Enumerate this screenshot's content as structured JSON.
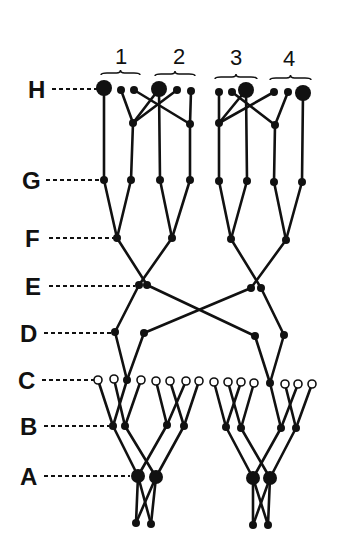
{
  "title_fragment": "(a)",
  "levels": [
    {
      "label": "H",
      "y": 89,
      "label_x": 28,
      "dash_to": 100
    },
    {
      "label": "G",
      "y": 180,
      "label_x": 22,
      "dash_to": 101
    },
    {
      "label": "F",
      "y": 238,
      "label_x": 25,
      "dash_to": 114
    },
    {
      "label": "E",
      "y": 286,
      "label_x": 25,
      "dash_to": 135
    },
    {
      "label": "D",
      "y": 333,
      "label_x": 20,
      "dash_to": 111
    },
    {
      "label": "C",
      "y": 380,
      "label_x": 18,
      "dash_to": 94
    },
    {
      "label": "B",
      "y": 426,
      "label_x": 20,
      "dash_to": 109
    },
    {
      "label": "A",
      "y": 476,
      "label_x": 20,
      "dash_to": 130
    }
  ],
  "groups": [
    {
      "label": "1",
      "x": 121,
      "brace": [
        101,
        140,
        73
      ]
    },
    {
      "label": "2",
      "x": 179,
      "brace": [
        155,
        195,
        74
      ]
    },
    {
      "label": "3",
      "x": 236,
      "brace": [
        215,
        257,
        77
      ]
    },
    {
      "label": "4",
      "x": 289,
      "brace": [
        270,
        311,
        78
      ]
    }
  ],
  "nodes": {
    "H": [
      {
        "x": 104,
        "y": 88,
        "r": 8,
        "type": "filled"
      },
      {
        "x": 121,
        "y": 90,
        "r": 4,
        "type": "filled"
      },
      {
        "x": 134,
        "y": 90,
        "r": 4,
        "type": "filled"
      },
      {
        "x": 159,
        "y": 89,
        "r": 8,
        "type": "filled"
      },
      {
        "x": 177,
        "y": 90,
        "r": 4,
        "type": "filled"
      },
      {
        "x": 191,
        "y": 91,
        "r": 4,
        "type": "filled"
      },
      {
        "x": 219,
        "y": 92,
        "r": 4,
        "type": "filled"
      },
      {
        "x": 232,
        "y": 92,
        "r": 4,
        "type": "filled"
      },
      {
        "x": 246,
        "y": 90,
        "r": 8,
        "type": "filled"
      },
      {
        "x": 274,
        "y": 92,
        "r": 4,
        "type": "filled"
      },
      {
        "x": 288,
        "y": 92,
        "r": 4,
        "type": "filled"
      },
      {
        "x": 303,
        "y": 93,
        "r": 8,
        "type": "filled"
      }
    ],
    "H_mid": [
      {
        "x": 133,
        "y": 123,
        "r": 4,
        "type": "filled"
      },
      {
        "x": 190,
        "y": 124,
        "r": 4,
        "type": "filled"
      },
      {
        "x": 219,
        "y": 123,
        "r": 4,
        "type": "filled"
      },
      {
        "x": 275,
        "y": 125,
        "r": 4,
        "type": "filled"
      }
    ],
    "G": [
      {
        "x": 104,
        "y": 180,
        "r": 4,
        "type": "filled"
      },
      {
        "x": 131,
        "y": 180,
        "r": 4,
        "type": "filled"
      },
      {
        "x": 160,
        "y": 180,
        "r": 4,
        "type": "filled"
      },
      {
        "x": 190,
        "y": 180,
        "r": 4,
        "type": "filled"
      },
      {
        "x": 219,
        "y": 181,
        "r": 4,
        "type": "filled"
      },
      {
        "x": 247,
        "y": 181,
        "r": 4,
        "type": "filled"
      },
      {
        "x": 274,
        "y": 182,
        "r": 4,
        "type": "filled"
      },
      {
        "x": 302,
        "y": 182,
        "r": 4,
        "type": "filled"
      }
    ],
    "F": [
      {
        "x": 117,
        "y": 238,
        "r": 4,
        "type": "filled"
      },
      {
        "x": 172,
        "y": 238,
        "r": 4,
        "type": "filled"
      },
      {
        "x": 231,
        "y": 239,
        "r": 4,
        "type": "filled"
      },
      {
        "x": 286,
        "y": 240,
        "r": 4,
        "type": "filled"
      }
    ],
    "E": [
      {
        "x": 139,
        "y": 285,
        "r": 4,
        "type": "filled"
      },
      {
        "x": 147,
        "y": 285,
        "r": 4,
        "type": "filled"
      },
      {
        "x": 251,
        "y": 288,
        "r": 4,
        "type": "filled"
      },
      {
        "x": 261,
        "y": 288,
        "r": 4,
        "type": "filled"
      }
    ],
    "D": [
      {
        "x": 115,
        "y": 332,
        "r": 4,
        "type": "filled"
      },
      {
        "x": 144,
        "y": 333,
        "r": 4,
        "type": "filled"
      },
      {
        "x": 255,
        "y": 336,
        "r": 4,
        "type": "filled"
      },
      {
        "x": 284,
        "y": 335,
        "r": 4,
        "type": "filled"
      }
    ],
    "C": [
      {
        "x": 98,
        "y": 380,
        "r": 4,
        "type": "open"
      },
      {
        "x": 114,
        "y": 379,
        "r": 4,
        "type": "open"
      },
      {
        "x": 127,
        "y": 380,
        "r": 4,
        "type": "filled"
      },
      {
        "x": 141,
        "y": 380,
        "r": 4,
        "type": "open"
      },
      {
        "x": 156,
        "y": 381,
        "r": 4,
        "type": "open"
      },
      {
        "x": 170,
        "y": 381,
        "r": 4,
        "type": "open"
      },
      {
        "x": 186,
        "y": 381,
        "r": 4,
        "type": "open"
      },
      {
        "x": 199,
        "y": 381,
        "r": 4,
        "type": "open"
      },
      {
        "x": 214,
        "y": 382,
        "r": 4,
        "type": "open"
      },
      {
        "x": 228,
        "y": 382,
        "r": 4,
        "type": "open"
      },
      {
        "x": 241,
        "y": 382,
        "r": 4,
        "type": "open"
      },
      {
        "x": 254,
        "y": 383,
        "r": 4,
        "type": "open"
      },
      {
        "x": 270,
        "y": 383,
        "r": 4,
        "type": "filled"
      },
      {
        "x": 285,
        "y": 384,
        "r": 4,
        "type": "open"
      },
      {
        "x": 298,
        "y": 384,
        "r": 4,
        "type": "open"
      },
      {
        "x": 312,
        "y": 384,
        "r": 4,
        "type": "open"
      }
    ],
    "B": [
      {
        "x": 113,
        "y": 426,
        "r": 4,
        "type": "filled"
      },
      {
        "x": 125,
        "y": 426,
        "r": 4,
        "type": "filled"
      },
      {
        "x": 167,
        "y": 425,
        "r": 4,
        "type": "filled"
      },
      {
        "x": 184,
        "y": 426,
        "r": 4,
        "type": "filled"
      },
      {
        "x": 226,
        "y": 427,
        "r": 4,
        "type": "filled"
      },
      {
        "x": 241,
        "y": 428,
        "r": 4,
        "type": "filled"
      },
      {
        "x": 281,
        "y": 428,
        "r": 4,
        "type": "filled"
      },
      {
        "x": 296,
        "y": 428,
        "r": 4,
        "type": "filled"
      }
    ],
    "A": [
      {
        "x": 138,
        "y": 476,
        "r": 7,
        "type": "filled"
      },
      {
        "x": 156,
        "y": 477,
        "r": 7,
        "type": "filled"
      },
      {
        "x": 253,
        "y": 478,
        "r": 7,
        "type": "filled"
      },
      {
        "x": 270,
        "y": 478,
        "r": 7,
        "type": "filled"
      }
    ],
    "Z": [
      {
        "x": 136,
        "y": 523,
        "r": 4,
        "type": "filled"
      },
      {
        "x": 151,
        "y": 524,
        "r": 4,
        "type": "filled"
      },
      {
        "x": 253,
        "y": 525,
        "r": 4,
        "type": "filled"
      },
      {
        "x": 268,
        "y": 525,
        "r": 4,
        "type": "filled"
      }
    ]
  },
  "edges": [
    [
      104,
      88,
      104,
      180
    ],
    [
      121,
      90,
      133,
      123
    ],
    [
      134,
      90,
      190,
      124
    ],
    [
      159,
      89,
      133,
      123
    ],
    [
      159,
      89,
      160,
      180
    ],
    [
      177,
      90,
      133,
      123
    ],
    [
      191,
      91,
      190,
      124
    ],
    [
      133,
      123,
      131,
      180
    ],
    [
      190,
      124,
      190,
      180
    ],
    [
      219,
      92,
      219,
      123
    ],
    [
      232,
      92,
      275,
      125
    ],
    [
      246,
      90,
      219,
      123
    ],
    [
      246,
      90,
      247,
      180
    ],
    [
      274,
      92,
      219,
      123
    ],
    [
      288,
      92,
      275,
      125
    ],
    [
      303,
      93,
      302,
      182
    ],
    [
      219,
      123,
      219,
      181
    ],
    [
      275,
      125,
      274,
      182
    ],
    [
      104,
      180,
      117,
      238
    ],
    [
      131,
      180,
      117,
      238
    ],
    [
      160,
      180,
      172,
      238
    ],
    [
      190,
      180,
      172,
      238
    ],
    [
      219,
      181,
      231,
      239
    ],
    [
      247,
      181,
      231,
      239
    ],
    [
      274,
      182,
      286,
      240
    ],
    [
      302,
      182,
      286,
      240
    ],
    [
      117,
      238,
      147,
      285
    ],
    [
      172,
      238,
      139,
      285
    ],
    [
      231,
      239,
      261,
      288
    ],
    [
      286,
      240,
      251,
      288
    ],
    [
      139,
      285,
      115,
      332
    ],
    [
      147,
      285,
      255,
      336
    ],
    [
      251,
      288,
      144,
      333
    ],
    [
      261,
      288,
      284,
      335
    ],
    [
      115,
      332,
      127,
      380
    ],
    [
      144,
      333,
      127,
      380
    ],
    [
      255,
      336,
      270,
      383
    ],
    [
      284,
      335,
      270,
      383
    ],
    [
      98,
      380,
      113,
      426
    ],
    [
      127,
      380,
      113,
      426
    ],
    [
      114,
      379,
      125,
      426
    ],
    [
      141,
      380,
      125,
      426
    ],
    [
      156,
      381,
      167,
      425
    ],
    [
      186,
      381,
      167,
      425
    ],
    [
      170,
      381,
      184,
      426
    ],
    [
      199,
      381,
      184,
      426
    ],
    [
      214,
      382,
      226,
      427
    ],
    [
      241,
      382,
      226,
      427
    ],
    [
      228,
      382,
      241,
      428
    ],
    [
      254,
      383,
      241,
      428
    ],
    [
      270,
      383,
      281,
      428
    ],
    [
      298,
      384,
      281,
      428
    ],
    [
      285,
      384,
      296,
      428
    ],
    [
      312,
      384,
      296,
      428
    ],
    [
      113,
      426,
      138,
      476
    ],
    [
      167,
      425,
      138,
      476
    ],
    [
      125,
      426,
      156,
      477
    ],
    [
      184,
      426,
      156,
      477
    ],
    [
      226,
      427,
      253,
      478
    ],
    [
      281,
      428,
      253,
      478
    ],
    [
      241,
      428,
      270,
      478
    ],
    [
      296,
      428,
      270,
      478
    ],
    [
      138,
      476,
      136,
      523
    ],
    [
      138,
      476,
      151,
      524
    ],
    [
      156,
      477,
      136,
      523
    ],
    [
      156,
      477,
      151,
      524
    ],
    [
      253,
      478,
      253,
      525
    ],
    [
      253,
      478,
      268,
      525
    ],
    [
      270,
      478,
      253,
      525
    ],
    [
      270,
      478,
      268,
      525
    ]
  ]
}
